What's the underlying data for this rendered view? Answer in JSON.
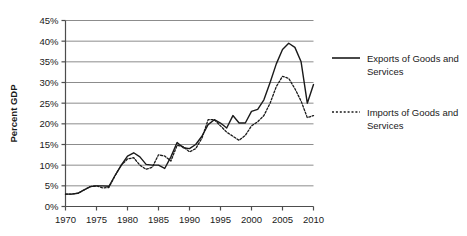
{
  "chart_data": {
    "type": "line",
    "title": "",
    "xlabel": "",
    "ylabel": "Percent GDP",
    "xlim": [
      1970,
      2010
    ],
    "ylim": [
      0,
      45
    ],
    "ytick_labels": [
      "0%",
      "5%",
      "10%",
      "15%",
      "20%",
      "25%",
      "30%",
      "35%",
      "40%",
      "45%"
    ],
    "ytick_values": [
      0,
      5,
      10,
      15,
      20,
      25,
      30,
      35,
      40,
      45
    ],
    "xtick_labels": [
      "1970",
      "1975",
      "1980",
      "1985",
      "1990",
      "1995",
      "2000",
      "2005",
      "2010"
    ],
    "xtick_values": [
      1970,
      1975,
      1980,
      1985,
      1990,
      1995,
      2000,
      2005,
      2010
    ],
    "grid": "horizontal",
    "legend_position": "right",
    "x": [
      1970,
      1971,
      1972,
      1973,
      1974,
      1975,
      1976,
      1977,
      1978,
      1979,
      1980,
      1981,
      1982,
      1983,
      1984,
      1985,
      1986,
      1987,
      1988,
      1989,
      1990,
      1991,
      1992,
      1993,
      1994,
      1995,
      1996,
      1997,
      1998,
      1999,
      2000,
      2001,
      2002,
      2003,
      2004,
      2005,
      2006,
      2007,
      2008,
      2009,
      2010
    ],
    "series": [
      {
        "name": "Exports of Goods and Services",
        "style": "solid",
        "color": "#1a1a1a",
        "values": [
          3.0,
          3.0,
          3.2,
          4.0,
          4.8,
          5.0,
          5.0,
          4.9,
          7.5,
          10.0,
          12.2,
          13.0,
          12.0,
          10.2,
          10.0,
          10.0,
          9.2,
          12.0,
          15.5,
          14.2,
          14.0,
          15.0,
          17.0,
          19.8,
          21.0,
          20.2,
          19.0,
          22.0,
          20.2,
          20.2,
          23.0,
          23.5,
          25.8,
          30.0,
          34.5,
          38.0,
          39.5,
          38.5,
          35.0,
          25.0,
          29.5
        ]
      },
      {
        "name": "Imports of Goods and Services",
        "style": "dotted",
        "color": "#1a1a1a",
        "values": [
          3.0,
          3.0,
          3.2,
          4.0,
          4.8,
          5.0,
          4.5,
          4.6,
          7.5,
          10.0,
          11.5,
          11.8,
          10.0,
          9.0,
          9.5,
          12.5,
          12.2,
          11.0,
          14.8,
          14.5,
          13.2,
          14.0,
          16.5,
          21.0,
          21.0,
          19.5,
          18.0,
          17.0,
          16.0,
          17.2,
          19.5,
          20.5,
          22.0,
          25.0,
          29.0,
          31.5,
          31.0,
          28.5,
          25.5,
          21.5,
          22.0
        ]
      }
    ]
  }
}
